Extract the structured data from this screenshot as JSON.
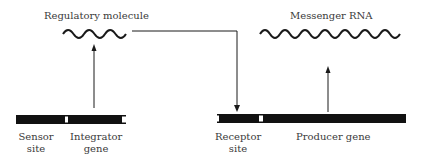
{
  "diagram": {
    "labels": {
      "regulatory_molecule": "Regulatory molecule",
      "messenger_rna": "Messenger RNA",
      "sensor_site_1": "Sensor",
      "sensor_site_2": "site",
      "integrator_gene_1": "Integrator",
      "integrator_gene_2": "gene",
      "receptor_site_1": "Receptor",
      "receptor_site_2": "site",
      "producer_gene": "Producer gene"
    },
    "colors": {
      "line": "#1a1a1a",
      "bar": "#111111",
      "text": "#3a3a3a"
    }
  }
}
